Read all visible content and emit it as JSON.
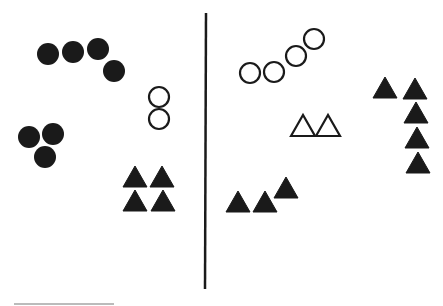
{
  "figure": {
    "width": 443,
    "height": 306,
    "colors": {
      "ink": "#1a1a1a",
      "background": "#ffffff",
      "caption": "#bbbbbb"
    },
    "divider": {
      "x1": 206,
      "y1": 13,
      "x2": 205,
      "y2": 289
    },
    "left_panel": {
      "filled_circles": [
        {
          "cx": 48,
          "cy": 54
        },
        {
          "cx": 73,
          "cy": 52
        },
        {
          "cx": 98,
          "cy": 49
        },
        {
          "cx": 114,
          "cy": 71
        },
        {
          "cx": 29,
          "cy": 137
        },
        {
          "cx": 53,
          "cy": 134
        },
        {
          "cx": 45,
          "cy": 157
        }
      ],
      "open_circles": [
        {
          "cx": 159,
          "cy": 97
        },
        {
          "cx": 159,
          "cy": 119
        }
      ],
      "filled_triangles": [
        {
          "x": 123,
          "y": 166
        },
        {
          "x": 150,
          "y": 166
        },
        {
          "x": 123,
          "y": 190
        },
        {
          "x": 151,
          "y": 190
        }
      ]
    },
    "right_panel": {
      "open_circles": [
        {
          "cx": 250,
          "cy": 73
        },
        {
          "cx": 274,
          "cy": 72
        },
        {
          "cx": 296,
          "cy": 56
        },
        {
          "cx": 314,
          "cy": 39
        }
      ],
      "open_triangles": [
        {
          "x": 291,
          "y": 115
        },
        {
          "x": 316,
          "y": 115
        }
      ],
      "filled_triangles": [
        {
          "x": 226,
          "y": 191
        },
        {
          "x": 253,
          "y": 191
        },
        {
          "x": 274,
          "y": 177
        },
        {
          "x": 373,
          "y": 77
        },
        {
          "x": 403,
          "y": 78
        },
        {
          "x": 404,
          "y": 102
        },
        {
          "x": 405,
          "y": 127
        },
        {
          "x": 406,
          "y": 152
        }
      ]
    },
    "circle_radius": 11,
    "triangle_size": {
      "w": 24,
      "h": 21
    }
  }
}
